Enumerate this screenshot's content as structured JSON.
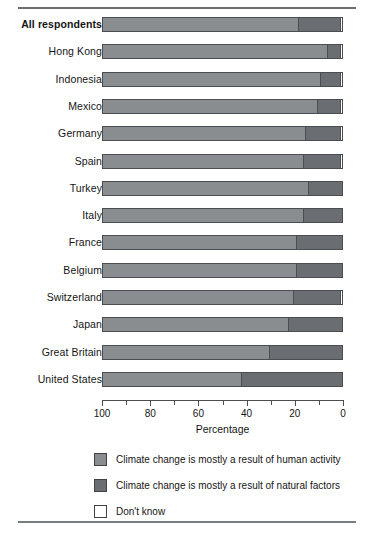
{
  "chart_data": {
    "type": "bar",
    "orientation": "horizontal-stacked",
    "title": "",
    "xlabel": "Percentage",
    "ylabel": "",
    "xlim": [
      100,
      0
    ],
    "x_axis_reversed": true,
    "xticks": [
      100,
      80,
      60,
      40,
      20,
      0
    ],
    "xtick_labels": [
      "100",
      "80",
      "60",
      "40",
      "20",
      "0"
    ],
    "minor_ticks": [
      90,
      70,
      50,
      30,
      10
    ],
    "grid": false,
    "legend_position": "bottom",
    "categories": [
      "All respondents",
      "Hong Kong",
      "Indonesia",
      "Mexico",
      "Germany",
      "Spain",
      "Turkey",
      "Italy",
      "France",
      "Belgium",
      "Switzerland",
      "Japan",
      "Great Britain",
      "United States"
    ],
    "series": [
      {
        "name": "Climate change is mostly a result of human activity",
        "color": "#8a8d90",
        "values": [
          82,
          94,
          91,
          90,
          85,
          84,
          86,
          84,
          81,
          81,
          80,
          78,
          70,
          58
        ]
      },
      {
        "name": "Climate change is mostly a result of natural factors",
        "color": "#6a6d71",
        "values": [
          17,
          5,
          8,
          9,
          14,
          15,
          14,
          16,
          19,
          19,
          19,
          22,
          30,
          42
        ]
      },
      {
        "name": "Don't know",
        "color": "#ffffff",
        "values": [
          1,
          1,
          1,
          1,
          1,
          1,
          0,
          0,
          0,
          0,
          1,
          0,
          0,
          0
        ]
      }
    ]
  },
  "legend": {
    "items": [
      {
        "label": "Climate change is mostly a result of human activity",
        "swatch": "human"
      },
      {
        "label": "Climate change is mostly a result of natural factors",
        "swatch": "natural"
      },
      {
        "label": "Don't know",
        "swatch": "dk"
      }
    ]
  },
  "axis": {
    "title": "Percentage"
  },
  "colors": {
    "human_activity": "#8a8d90",
    "natural_factors": "#6a6d71",
    "dont_know": "#ffffff",
    "outline": "#4a4e52",
    "rule": "#6b6f74"
  }
}
